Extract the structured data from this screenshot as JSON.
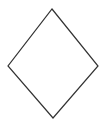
{
  "diagram": {
    "shape": "diamond",
    "vertices": {
      "top": [
        52,
        9
      ],
      "right": [
        98,
        66
      ],
      "bottom": [
        53,
        118
      ],
      "left": [
        8,
        66
      ]
    },
    "stroke_color": "#333333",
    "fill_color": "#ffffff",
    "stroke_width": 1.2
  }
}
